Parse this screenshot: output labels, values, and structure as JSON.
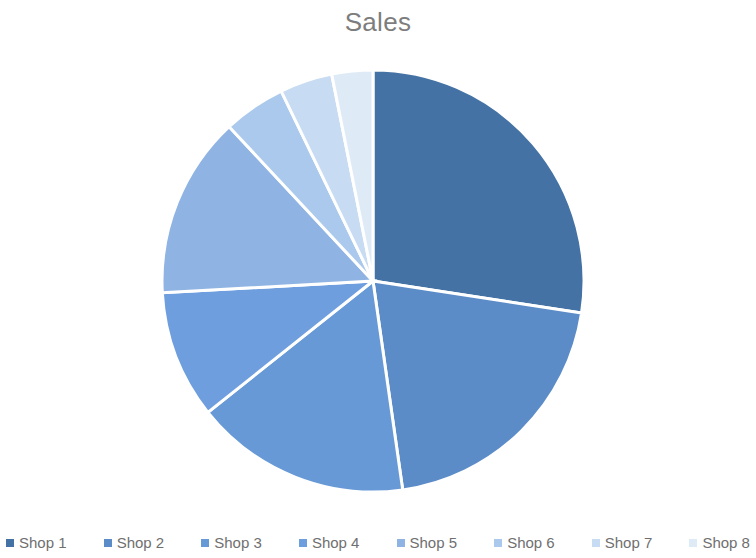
{
  "chart_data": {
    "type": "pie",
    "title": "Sales",
    "xlabel": "",
    "ylabel": "",
    "categories": [
      "Shop 1",
      "Shop 2",
      "Shop 3",
      "Shop 4",
      "Shop 5",
      "Shop 6",
      "Shop 7",
      "Shop 8"
    ],
    "values": [
      27.4,
      20.3,
      16.6,
      9.8,
      13.9,
      4.8,
      4.0,
      3.1
    ],
    "unit": "percent",
    "start_angle_deg": 0,
    "direction": "clockwise",
    "legend_position": "bottom",
    "grid": false,
    "colors": [
      "#4472a4",
      "#5b8cc8",
      "#6699d6",
      "#6f9ede",
      "#8fb4e3",
      "#aac9ec",
      "#c7dbf2",
      "#deebf7"
    ],
    "slices": [
      {
        "label": "Shop 1",
        "value": 27.4,
        "start_deg": 0.0,
        "end_deg": 98.7,
        "color": "#4472a4"
      },
      {
        "label": "Shop 2",
        "value": 20.3,
        "start_deg": 98.7,
        "end_deg": 171.9,
        "color": "#5b8cc8"
      },
      {
        "label": "Shop 3",
        "value": 16.6,
        "start_deg": 171.9,
        "end_deg": 231.5,
        "color": "#6699d6"
      },
      {
        "label": "Shop 4",
        "value": 9.8,
        "start_deg": 231.5,
        "end_deg": 266.8,
        "color": "#6f9ede"
      },
      {
        "label": "Shop 5",
        "value": 13.9,
        "start_deg": 266.8,
        "end_deg": 317.0,
        "color": "#8fb4e3"
      },
      {
        "label": "Shop 6",
        "value": 4.8,
        "start_deg": 317.0,
        "end_deg": 334.2,
        "color": "#aac9ec"
      },
      {
        "label": "Shop 7",
        "value": 4.0,
        "start_deg": 334.2,
        "end_deg": 348.7,
        "color": "#c7dbf2"
      },
      {
        "label": "Shop 8",
        "value": 3.1,
        "start_deg": 348.7,
        "end_deg": 360.0,
        "color": "#deebf7"
      }
    ],
    "geometry": {
      "center_x": 373,
      "center_y": 237,
      "radius": 211
    }
  },
  "chart": {
    "title": "Sales"
  },
  "legend": {
    "items": [
      {
        "label": "Shop 1",
        "color": "#4472a4"
      },
      {
        "label": "Shop 2",
        "color": "#5b8cc8"
      },
      {
        "label": "Shop 3",
        "color": "#6699d6"
      },
      {
        "label": "Shop 4",
        "color": "#6f9ede"
      },
      {
        "label": "Shop 5",
        "color": "#8fb4e3"
      },
      {
        "label": "Shop 6",
        "color": "#aac9ec"
      },
      {
        "label": "Shop 7",
        "color": "#c7dbf2"
      },
      {
        "label": "Shop 8",
        "color": "#deebf7"
      }
    ]
  }
}
